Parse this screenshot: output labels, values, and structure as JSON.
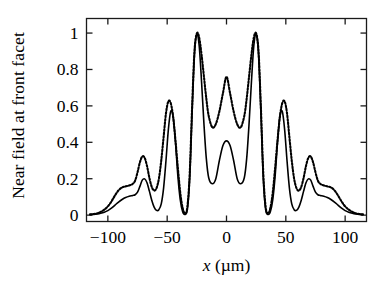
{
  "chart_data": {
    "type": "line",
    "title": "",
    "xlabel": "x (µm)",
    "ylabel": "Near field at front facet",
    "xlim": [
      -118,
      118
    ],
    "ylim": [
      -0.035,
      1.08
    ],
    "xticks": [
      -100,
      -50,
      0,
      50,
      100
    ],
    "xticklabels": [
      "−100",
      "−50",
      "0",
      "50",
      "100"
    ],
    "yticks": [
      0,
      0.2,
      0.4,
      0.6,
      0.8,
      1
    ],
    "yticklabels": [
      "0",
      "0.2",
      "0.4",
      "0.6",
      "0.8",
      "1"
    ],
    "grid": false,
    "legend": "none",
    "frame": "box",
    "series": [
      {
        "name": "solid",
        "style": "solid",
        "color": "#000000",
        "linewidth": 1.6,
        "x": [
          -115,
          -112,
          -109,
          -106,
          -103,
          -100,
          -97,
          -94,
          -91,
          -88,
          -85,
          -82,
          -79,
          -77,
          -75,
          -73,
          -71,
          -69,
          -67,
          -65,
          -63,
          -61,
          -59,
          -57,
          -55,
          -53,
          -51,
          -49,
          -47,
          -45,
          -43,
          -41,
          -39,
          -37,
          -35,
          -33,
          -31,
          -29,
          -27,
          -25,
          -23,
          -21,
          -19,
          -17,
          -15,
          -12,
          -9,
          -6,
          -3,
          0,
          3,
          6,
          9,
          12,
          15,
          17,
          19,
          21,
          23,
          25,
          27,
          29,
          31,
          33,
          35,
          37,
          39,
          41,
          43,
          45,
          47,
          49,
          51,
          53,
          55,
          57,
          59,
          61,
          63,
          65,
          67,
          69,
          71,
          73,
          75,
          77,
          79,
          82,
          85,
          88,
          91,
          94,
          97,
          100,
          103,
          106,
          109,
          112,
          115
        ],
        "y": [
          0.003,
          0.004,
          0.006,
          0.01,
          0.016,
          0.025,
          0.038,
          0.055,
          0.072,
          0.086,
          0.097,
          0.104,
          0.108,
          0.112,
          0.126,
          0.158,
          0.192,
          0.199,
          0.178,
          0.132,
          0.082,
          0.044,
          0.026,
          0.03,
          0.062,
          0.15,
          0.3,
          0.47,
          0.57,
          0.545,
          0.4,
          0.215,
          0.085,
          0.02,
          0.004,
          0.03,
          0.2,
          0.56,
          0.88,
          0.995,
          0.93,
          0.73,
          0.5,
          0.31,
          0.205,
          0.172,
          0.2,
          0.3,
          0.382,
          0.408,
          0.382,
          0.3,
          0.2,
          0.172,
          0.205,
          0.31,
          0.5,
          0.73,
          0.93,
          0.995,
          0.88,
          0.56,
          0.2,
          0.03,
          0.004,
          0.02,
          0.085,
          0.215,
          0.4,
          0.545,
          0.57,
          0.47,
          0.3,
          0.15,
          0.062,
          0.03,
          0.026,
          0.044,
          0.082,
          0.132,
          0.178,
          0.199,
          0.192,
          0.158,
          0.126,
          0.112,
          0.108,
          0.104,
          0.097,
          0.086,
          0.072,
          0.055,
          0.038,
          0.025,
          0.016,
          0.01,
          0.006,
          0.004,
          0.003
        ]
      },
      {
        "name": "dotted",
        "style": "dotted",
        "color": "#000000",
        "linewidth": 2.1,
        "x": [
          -115,
          -112,
          -109,
          -106,
          -103,
          -100,
          -97,
          -94,
          -91,
          -88,
          -85,
          -82,
          -79,
          -77,
          -75,
          -73,
          -71,
          -69,
          -67,
          -65,
          -63,
          -61,
          -59,
          -57,
          -55,
          -53,
          -51,
          -49,
          -47,
          -45,
          -43,
          -41,
          -39,
          -37,
          -35,
          -33,
          -31,
          -29,
          -27,
          -25,
          -23,
          -21,
          -19,
          -17,
          -15,
          -12,
          -9,
          -6,
          -3,
          0,
          3,
          6,
          9,
          12,
          15,
          17,
          19,
          21,
          23,
          25,
          27,
          29,
          31,
          33,
          35,
          37,
          39,
          41,
          43,
          45,
          47,
          49,
          51,
          53,
          55,
          57,
          59,
          61,
          63,
          65,
          67,
          69,
          71,
          73,
          75,
          77,
          79,
          82,
          85,
          88,
          91,
          94,
          97,
          100,
          103,
          106,
          109,
          112,
          115
        ],
        "y": [
          0.004,
          0.006,
          0.01,
          0.018,
          0.03,
          0.048,
          0.075,
          0.108,
          0.136,
          0.152,
          0.158,
          0.163,
          0.172,
          0.19,
          0.235,
          0.29,
          0.322,
          0.315,
          0.27,
          0.205,
          0.155,
          0.135,
          0.148,
          0.2,
          0.3,
          0.43,
          0.56,
          0.625,
          0.615,
          0.54,
          0.41,
          0.26,
          0.125,
          0.04,
          0.01,
          0.045,
          0.23,
          0.59,
          0.9,
          0.998,
          0.975,
          0.88,
          0.76,
          0.64,
          0.545,
          0.482,
          0.5,
          0.57,
          0.67,
          0.76,
          0.67,
          0.57,
          0.5,
          0.482,
          0.545,
          0.64,
          0.76,
          0.88,
          0.975,
          0.998,
          0.9,
          0.59,
          0.23,
          0.045,
          0.01,
          0.04,
          0.125,
          0.26,
          0.41,
          0.54,
          0.615,
          0.625,
          0.56,
          0.43,
          0.3,
          0.2,
          0.148,
          0.135,
          0.155,
          0.205,
          0.27,
          0.315,
          0.322,
          0.29,
          0.235,
          0.19,
          0.172,
          0.163,
          0.158,
          0.152,
          0.136,
          0.108,
          0.075,
          0.048,
          0.03,
          0.018,
          0.01,
          0.006,
          0.004
        ]
      }
    ]
  }
}
